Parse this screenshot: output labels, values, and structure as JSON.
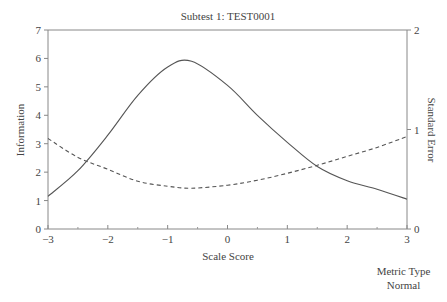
{
  "chart_data": {
    "type": "line",
    "title": "Subtest 1: TEST0001",
    "xlabel": "Scale Score",
    "ylabel": "Information",
    "y2label": "Standard Error",
    "xlim": [
      -3,
      3
    ],
    "ylim": [
      0,
      7
    ],
    "y2lim": [
      0,
      2
    ],
    "x_ticks": [
      -3,
      -2,
      -1,
      0,
      1,
      2,
      3
    ],
    "x_minor_ticks": [
      -2.5,
      -1.5,
      -0.5,
      0.5,
      1.5,
      2.5
    ],
    "y_ticks": [
      0,
      1,
      2,
      3,
      4,
      5,
      6,
      7
    ],
    "y2_ticks": [
      0,
      1,
      2
    ],
    "grid": false,
    "legend": null,
    "series": [
      {
        "name": "Information",
        "axis": "left",
        "style": "solid",
        "x": [
          -3,
          -2.5,
          -2,
          -1.5,
          -1,
          -0.6,
          0,
          0.5,
          1,
          1.5,
          2,
          2.5,
          3
        ],
        "values": [
          1.15,
          2.05,
          3.3,
          4.7,
          5.7,
          5.9,
          5.05,
          4.0,
          3.05,
          2.2,
          1.7,
          1.4,
          1.05
        ]
      },
      {
        "name": "Standard Error",
        "axis": "right",
        "style": "dashed",
        "x": [
          -3,
          -2.5,
          -2,
          -1.5,
          -1,
          -0.6,
          0,
          0.5,
          1,
          1.5,
          2,
          2.5,
          3
        ],
        "values": [
          0.91,
          0.72,
          0.6,
          0.48,
          0.43,
          0.41,
          0.44,
          0.49,
          0.56,
          0.64,
          0.73,
          0.82,
          0.93
        ]
      }
    ]
  },
  "footer": {
    "line1": "Metric Type",
    "line2": "Normal"
  }
}
